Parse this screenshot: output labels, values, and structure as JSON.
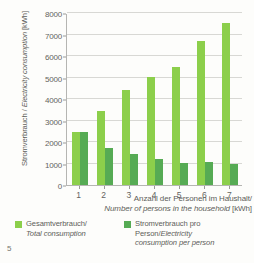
{
  "page_number": "5",
  "chart_data": {
    "type": "bar",
    "title": "",
    "subtitle": "",
    "xlabel_de": "Anzahl der Personen im Haushalt/",
    "xlabel_en": "Number of persons in the household",
    "xlabel_unit": "[kWh]",
    "ylabel_de": "Stromverbrauch / ",
    "ylabel_en": "Electricity consumption",
    "ylabel_unit": " [kWh]",
    "categories": [
      "1",
      "2",
      "3",
      "4",
      "5",
      "6",
      "7"
    ],
    "series": [
      {
        "name": "Gesamtverbrauch/ Total consumption",
        "name_de": "Gesamtverbrauch/",
        "name_en": "Total consumption",
        "color": "#8ccf4b",
        "values": [
          2450,
          3450,
          4420,
          5030,
          5510,
          6720,
          7550
        ]
      },
      {
        "name": "Stromverbrauch pro Person / Electricity consumption per person",
        "name_de": "Stromverbrauch pro Person/",
        "name_en": "Electricity consumption per person",
        "color": "#56ab54",
        "values": [
          2450,
          1720,
          1450,
          1200,
          1040,
          1080,
          1000
        ]
      }
    ],
    "ylim": [
      0,
      8000
    ],
    "y_ticks": [
      0,
      1000,
      2000,
      3000,
      4000,
      5000,
      6000,
      7000,
      8000
    ],
    "y_tick_labels": [
      "0",
      "1000",
      "2000",
      "3000",
      "4000",
      "5000",
      "6000",
      "7000",
      "8000"
    ],
    "grid": true,
    "legend_position": "bottom"
  },
  "legend": {
    "entries": [
      {
        "label_de": "Gesamtverbrauch/",
        "label_en": "Total consumption",
        "color": "#8ccf4b"
      },
      {
        "label_de": "Stromverbrauch pro",
        "label_de2": "Person/",
        "label_en": "Electricity",
        "label_en2": "consumption per person",
        "color": "#56ab54"
      }
    ]
  }
}
